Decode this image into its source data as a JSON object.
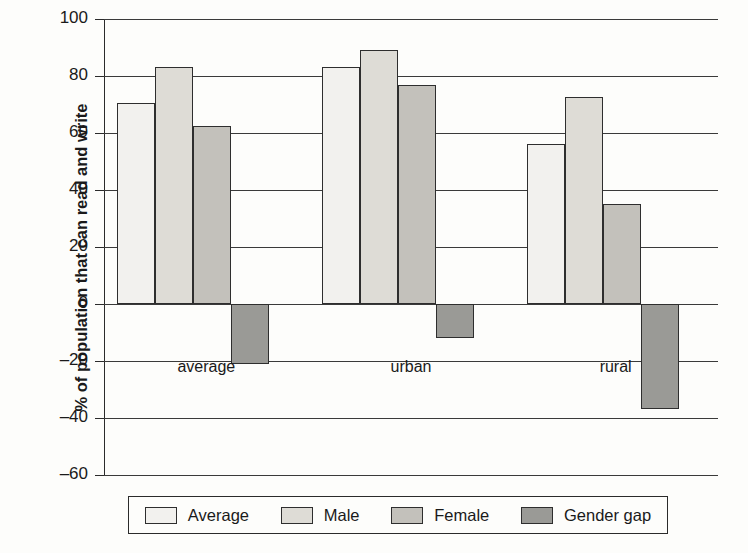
{
  "chart_data": {
    "type": "bar",
    "title": "",
    "subtitle": "",
    "xlabel": "",
    "ylabel": "% of population that can read and write",
    "categories": [
      "average",
      "urban",
      "rural"
    ],
    "series": [
      {
        "name": "Average",
        "color": "#f2f1ee",
        "values": [
          70.5,
          83.0,
          56.0
        ]
      },
      {
        "name": "Male",
        "color": "#dedcd6",
        "values": [
          83.0,
          89.0,
          72.5
        ]
      },
      {
        "name": "Female",
        "color": "#c3c1bb",
        "values": [
          62.5,
          77.0,
          35.0
        ]
      },
      {
        "name": "Gender gap",
        "color": "#9a9a96",
        "values": [
          -21.0,
          -12.0,
          -37.0
        ]
      }
    ],
    "ylim": [
      -60,
      100
    ],
    "yticks": [
      100,
      80,
      60,
      40,
      20,
      0,
      -20,
      -40,
      -60
    ],
    "ytick_labels": [
      "100",
      "80",
      "60",
      "40",
      "20",
      "0",
      "–20",
      "–40",
      "–60"
    ],
    "grid": true,
    "grid_axis": "y",
    "legend_position": "bottom",
    "bar_border_color": "#2e2e2e",
    "axis_color": "#2b2b2b",
    "background": "#fdfdfb"
  }
}
